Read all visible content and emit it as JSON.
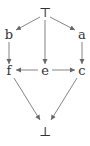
{
  "diagram": {
    "type": "hasse-lattice",
    "nodes": [
      {
        "id": "top",
        "label": "⊤",
        "x": 45,
        "y": 13
      },
      {
        "id": "b",
        "label": "b",
        "x": 9,
        "y": 35
      },
      {
        "id": "a",
        "label": "a",
        "x": 82,
        "y": 35
      },
      {
        "id": "f",
        "label": "f",
        "x": 9,
        "y": 73
      },
      {
        "id": "e",
        "label": "e",
        "x": 45,
        "y": 73
      },
      {
        "id": "c",
        "label": "c",
        "x": 82,
        "y": 73
      },
      {
        "id": "bottom",
        "label": "⊥",
        "x": 45,
        "y": 132
      }
    ],
    "edges": [
      {
        "from": "top",
        "to": "b"
      },
      {
        "from": "top",
        "to": "a"
      },
      {
        "from": "top",
        "to": "e"
      },
      {
        "from": "b",
        "to": "f"
      },
      {
        "from": "a",
        "to": "c"
      },
      {
        "from": "e",
        "to": "f"
      },
      {
        "from": "e",
        "to": "c"
      },
      {
        "from": "f",
        "to": "bottom"
      },
      {
        "from": "c",
        "to": "bottom"
      }
    ],
    "colors": {
      "edge": "#666666",
      "label": "#333333",
      "background": "#ffffff"
    }
  }
}
